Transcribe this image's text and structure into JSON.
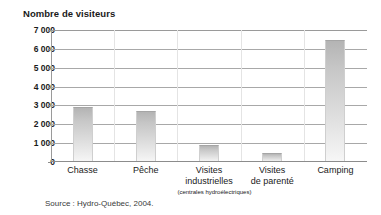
{
  "chart_data": {
    "type": "bar",
    "title": "Nombre de visiteurs",
    "xlabel": "",
    "ylabel": "Nombre de visiteurs",
    "categories": [
      "Chasse",
      "Pêche",
      "Visites industrielles",
      "Visites de parenté",
      "Camping"
    ],
    "category_lines": [
      {
        "line1": "Chasse",
        "line2": "",
        "sub": ""
      },
      {
        "line1": "Pêche",
        "line2": "",
        "sub": ""
      },
      {
        "line1": "Visites",
        "line2": "industrielles",
        "sub": "(centrales hydroélectriques)"
      },
      {
        "line1": "Visites",
        "line2": "de parenté",
        "sub": ""
      },
      {
        "line1": "Camping",
        "line2": "",
        "sub": ""
      }
    ],
    "values": [
      2900,
      2700,
      900,
      480,
      6450
    ],
    "ylim": [
      0,
      7000
    ],
    "ytick_values": [
      0,
      1000,
      2000,
      3000,
      4000,
      5000,
      6000,
      7000
    ],
    "ytick_labels": [
      "0",
      "1 000",
      "2 000",
      "3 000",
      "4 000",
      "5 000",
      "6 000",
      "7 000"
    ],
    "grid": true,
    "legend": "none",
    "source": "Source : Hydro-Québec, 2004.",
    "bar_color_top": "#b4b4b4",
    "bar_color_bottom": "#f7f7f7",
    "grid_color": "#a8a8a8",
    "axis_color": "#8c8c8c"
  }
}
